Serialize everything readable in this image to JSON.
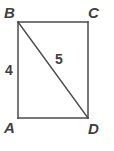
{
  "figure": {
    "kind": "geometry-diagram",
    "shape": "rectangle-with-diagonal",
    "background_color": "#ffffff",
    "stroke_color": "#4a4a4a",
    "text_color": "#3f3f3f",
    "stroke_width": 1.5,
    "vertices": [
      {
        "name": "B",
        "label": "B",
        "x": 18,
        "y": 22,
        "label_x": 4,
        "label_y": 5
      },
      {
        "name": "C",
        "label": "C",
        "x": 88,
        "y": 22,
        "label_x": 88,
        "label_y": 5
      },
      {
        "name": "D",
        "label": "D",
        "x": 88,
        "y": 118,
        "label_x": 88,
        "label_y": 121
      },
      {
        "name": "A",
        "label": "A",
        "x": 18,
        "y": 118,
        "label_x": 4,
        "label_y": 120
      }
    ],
    "edges": [
      {
        "name": "side-BC",
        "from": "B",
        "to": "C"
      },
      {
        "name": "side-CD",
        "from": "C",
        "to": "D"
      },
      {
        "name": "side-DA",
        "from": "D",
        "to": "A"
      },
      {
        "name": "side-AB",
        "from": "A",
        "to": "B"
      },
      {
        "name": "diagonal-BD",
        "from": "B",
        "to": "D"
      }
    ],
    "measurements": [
      {
        "name": "side-AB-length",
        "label": "4",
        "applies_to": "side-AB",
        "label_x": 5,
        "label_y": 63
      },
      {
        "name": "diagonal-BD-length",
        "label": "5",
        "applies_to": "diagonal-BD",
        "label_x": 55,
        "label_y": 52
      }
    ]
  }
}
